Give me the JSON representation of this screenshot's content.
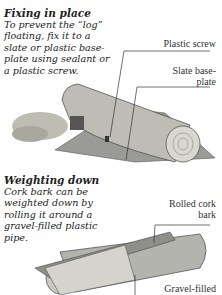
{
  "sections": [
    {
      "heading": "Fixing in place",
      "body": "To prevent the “log” floating, fix it to a slate or plastic base-plate using sealant or a plastic screw."
    },
    {
      "heading": "Weighting down",
      "body": "Cork bark can be weighted down by rolling it around a gravel-filled plastic pipe."
    }
  ],
  "labels": {
    "plastic_screw": "Plastic screw",
    "slate_base_plate": "Slate base-plate",
    "rolled_cork_bark": "Rolled cork bark",
    "gravel_filled": "Gravel-filled"
  }
}
